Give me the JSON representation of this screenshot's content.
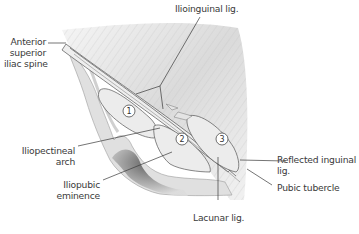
{
  "figure": {
    "type": "anatomical-illustration",
    "colors": {
      "background": "#ffffff",
      "muscle_shade": "#c8c8c8",
      "bone_fill": "#e2e2e2",
      "bone_shadow": "#6e6e6e",
      "ligament_fill": "#ececec",
      "leader_line": "#3a3a3a",
      "label_text": "#3a3a3a"
    }
  },
  "labels": {
    "ilioinguinal": "Ilioinguinal lig.",
    "asis_line1": "Anterior",
    "asis_line2": "superior",
    "asis_line3": "iliac spine",
    "iliopectineal_line1": "Iliopectineal",
    "iliopectineal_line2": "arch",
    "iliopubic_line1": "Iliopubic",
    "iliopubic_line2": "eminence",
    "reflected_line1": "Reflected inguinal",
    "reflected_line2": "lig.",
    "pubic_tubercle": "Pubic tubercle",
    "lacunar": "Lacunar lig."
  },
  "markers": [
    {
      "id": "1",
      "label": "1"
    },
    {
      "id": "2",
      "label": "2"
    },
    {
      "id": "3",
      "label": "3"
    }
  ]
}
